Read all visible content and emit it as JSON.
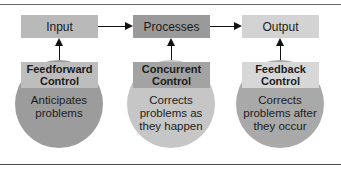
{
  "diagram": {
    "stages": [
      {
        "label": "Input",
        "color": "#b9b9b9"
      },
      {
        "label": "Processes",
        "color": "#9a9a9a"
      },
      {
        "label": "Output",
        "color": "#d3d3d3"
      }
    ],
    "controls": [
      {
        "title": "Feedforward Control",
        "description": "Anticipates problems",
        "box_color": "#bdbdbd",
        "circle_color": "#9c9c9c"
      },
      {
        "title": "Concurrent Control",
        "description": "Corrects problems as they happen",
        "box_color": "#a3a3a3",
        "circle_color": "#c6c6c6"
      },
      {
        "title": "Feedback Control",
        "description": "Corrects problems after they occur",
        "box_color": "#d7d7d7",
        "circle_color": "#a9a9a9"
      }
    ]
  }
}
